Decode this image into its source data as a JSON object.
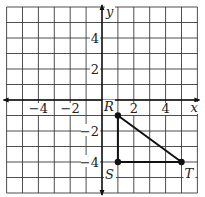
{
  "figure": {
    "type": "coordinate-grid",
    "x_range": [
      -6,
      6
    ],
    "y_range": [
      -6,
      6
    ],
    "grid_spacing": 1,
    "axis_labels": {
      "x": "x",
      "y": "y"
    },
    "x_tick_labels": [
      {
        "value": -4,
        "text": "−4"
      },
      {
        "value": -2,
        "text": "−2"
      },
      {
        "value": 2,
        "text": "2"
      },
      {
        "value": 4,
        "text": "4"
      }
    ],
    "y_tick_labels": [
      {
        "value": 4,
        "text": "4"
      },
      {
        "value": 2,
        "text": "2"
      },
      {
        "value": -2,
        "text": "−2"
      },
      {
        "value": -4,
        "text": "−4"
      }
    ],
    "points": [
      {
        "name": "R",
        "x": 1,
        "y": -1
      },
      {
        "name": "S",
        "x": 1,
        "y": -4
      },
      {
        "name": "T",
        "x": 5,
        "y": -4
      }
    ],
    "polygon": {
      "name": "triangle-RST",
      "vertices": [
        "R",
        "S",
        "T"
      ]
    },
    "colors": {
      "grid": "#3a3a3a",
      "axis": "#111111",
      "shape": "#111111",
      "background": "#ffffff"
    }
  }
}
